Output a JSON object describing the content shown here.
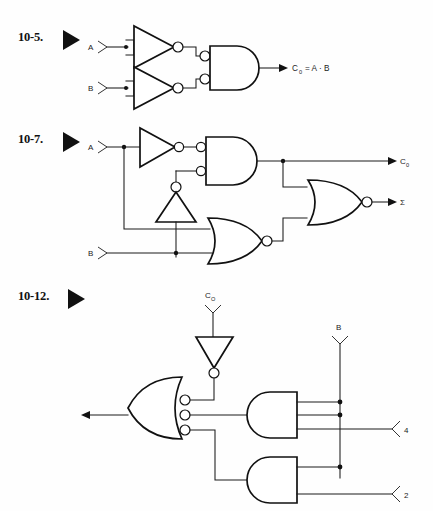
{
  "page": {
    "background": "#fefefe",
    "ink": "#111111",
    "width": 433,
    "height": 511
  },
  "problems": [
    {
      "id": "10-5",
      "number_label": "10-5.",
      "marker": "solid-right-triangle",
      "inputs": [
        {
          "name": "A",
          "label": "A"
        },
        {
          "name": "B",
          "label": "B"
        }
      ],
      "gates": [
        {
          "type": "inverter",
          "name": "inverter-a"
        },
        {
          "type": "inverter",
          "name": "inverter-b"
        },
        {
          "type": "and-bubbled-inputs",
          "name": "and-gate"
        }
      ],
      "outputs": [
        {
          "name": "carry-out",
          "label": "C",
          "subscript": "0",
          "equation": "= A · B"
        }
      ]
    },
    {
      "id": "10-7",
      "number_label": "10-7.",
      "marker": "solid-right-triangle",
      "inputs": [
        {
          "name": "A",
          "label": "A"
        },
        {
          "name": "B",
          "label": "B"
        }
      ],
      "gates": [
        {
          "type": "inverter",
          "name": "inverter-a"
        },
        {
          "type": "inverter-up",
          "name": "inverter-vertical"
        },
        {
          "type": "and-bubbled-inputs",
          "name": "and-gate"
        },
        {
          "type": "nor",
          "name": "nor-gate-lower"
        },
        {
          "type": "nor",
          "name": "nor-gate-output"
        }
      ],
      "outputs": [
        {
          "name": "carry-out",
          "label": "C",
          "subscript": "0"
        },
        {
          "name": "sum-out",
          "label": "Σ"
        }
      ]
    },
    {
      "id": "10-12",
      "number_label": "10-12.",
      "marker": "solid-right-triangle",
      "inputs": [
        {
          "name": "carry-in",
          "label": "C",
          "subscript": "O"
        },
        {
          "name": "B",
          "label": "B"
        },
        {
          "name": "four",
          "label": "4"
        },
        {
          "name": "two",
          "label": "2"
        }
      ],
      "gates": [
        {
          "type": "inverter-down",
          "name": "inverter-top"
        },
        {
          "type": "or-mirrored-bubbled-inputs",
          "name": "or-gate-output"
        },
        {
          "type": "nand-mirrored",
          "name": "nand-gate-upper"
        },
        {
          "type": "nand-mirrored",
          "name": "nand-gate-lower"
        }
      ],
      "outputs": [
        {
          "name": "left-output",
          "label": ""
        }
      ]
    }
  ]
}
